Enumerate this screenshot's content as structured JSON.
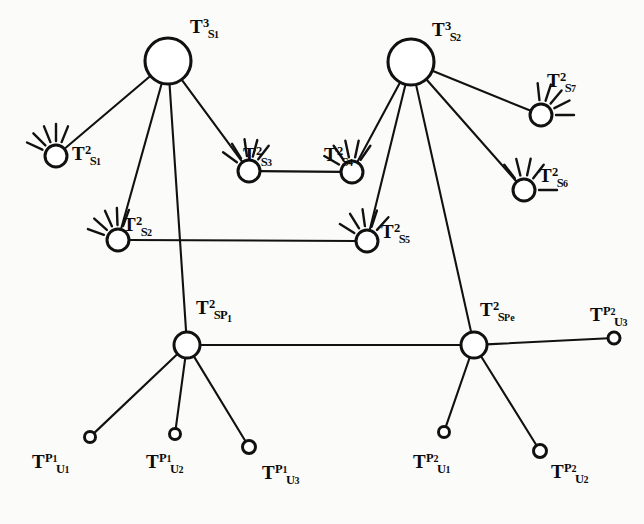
{
  "figure": {
    "type": "node-link-diagram",
    "background_color": "#fbfbf9",
    "ink_color": "#111111",
    "width": 644,
    "height": 524
  },
  "nodes": [
    {
      "id": "TS1_3",
      "kind": "hub",
      "label_base": "T",
      "label_sup": "3",
      "label_sub": "S",
      "label_subsub": "1",
      "x": 168,
      "y": 61,
      "r": 23,
      "label_x": 190,
      "label_y": 17,
      "rays": []
    },
    {
      "id": "TS2_3",
      "kind": "hub",
      "label_base": "T",
      "label_sup": "3",
      "label_sub": "S",
      "label_subsub": "2",
      "x": 411,
      "y": 62,
      "r": 23,
      "label_x": 432,
      "label_y": 20,
      "rays": []
    },
    {
      "id": "TS1_2",
      "kind": "mid",
      "label_base": "T",
      "label_sup": "2",
      "label_sub": "S",
      "label_subsub": "1",
      "x": 56,
      "y": 156,
      "r": 11,
      "label_x": 72,
      "label_y": 144,
      "rays": [
        205,
        225,
        248,
        270,
        292
      ]
    },
    {
      "id": "TS2_2",
      "kind": "mid",
      "label_base": "T",
      "label_sup": "2",
      "label_sub": "S",
      "label_subsub": "2",
      "x": 118,
      "y": 240,
      "r": 11,
      "label_x": 123,
      "label_y": 215,
      "rays": [
        200,
        222,
        246,
        268,
        290
      ]
    },
    {
      "id": "TS3_2",
      "kind": "mid",
      "label_base": "T",
      "label_sup": "2",
      "label_sub": "S",
      "label_subsub": "3",
      "x": 249,
      "y": 171,
      "r": 11,
      "label_x": 243,
      "label_y": 145,
      "rays": [
        216,
        238,
        262,
        285,
        308
      ]
    },
    {
      "id": "TS4_2",
      "kind": "mid",
      "label_base": "T",
      "label_sup": "2",
      "label_sub": "S",
      "label_subsub": "4",
      "x": 352,
      "y": 172,
      "r": 11,
      "label_x": 324,
      "label_y": 145,
      "rays": [
        210,
        235,
        258,
        282,
        305
      ]
    },
    {
      "id": "TS5_2",
      "kind": "mid",
      "label_base": "T",
      "label_sup": "2",
      "label_sub": "S",
      "label_subsub": "5",
      "x": 367,
      "y": 241,
      "r": 11,
      "label_x": 381,
      "label_y": 222,
      "rays": [
        212,
        238,
        262,
        288,
        312
      ]
    },
    {
      "id": "TS6_2",
      "kind": "mid",
      "label_base": "T",
      "label_sup": "2",
      "label_sub": "S",
      "label_subsub": "6",
      "x": 524,
      "y": 190,
      "r": 11,
      "label_x": 539,
      "label_y": 166,
      "rays": [
        0,
        232,
        256,
        282,
        308
      ]
    },
    {
      "id": "TS7_2",
      "kind": "mid",
      "label_base": "T",
      "label_sup": "2",
      "label_sub": "S",
      "label_subsub": "7",
      "x": 541,
      "y": 115,
      "r": 11,
      "label_x": 547,
      "label_y": 71,
      "rays": [
        0,
        333,
        310,
        288,
        264
      ]
    },
    {
      "id": "TSP1_2",
      "kind": "mid",
      "label_base": "T",
      "label_sup": "2",
      "label_sub": "S",
      "label_subsub": "P1",
      "x": 187,
      "y": 345,
      "r": 13,
      "label_x": 196,
      "label_y": 298,
      "rays": []
    },
    {
      "id": "TSPe_2",
      "kind": "mid",
      "label_base": "T",
      "label_sup": "2",
      "label_sub": "S",
      "label_subsub": "Pe",
      "x": 474,
      "y": 345,
      "r": 13,
      "label_x": 480,
      "label_y": 300,
      "rays": []
    },
    {
      "id": "TU1_P1",
      "kind": "leaf",
      "label_base": "T",
      "label_sup": "P1",
      "label_sub": "U",
      "label_subsub": "1",
      "x": 90,
      "y": 437,
      "r": 5.5,
      "label_x": 32,
      "label_y": 452,
      "rays": []
    },
    {
      "id": "TU2_P1",
      "kind": "leaf",
      "label_base": "T",
      "label_sup": "P1",
      "label_sub": "U",
      "label_subsub": "2",
      "x": 175,
      "y": 434,
      "r": 5.5,
      "label_x": 146,
      "label_y": 452,
      "rays": []
    },
    {
      "id": "TU3_P1",
      "kind": "leaf",
      "label_base": "T",
      "label_sup": "P1",
      "label_sub": "U",
      "label_subsub": "3",
      "x": 249,
      "y": 447,
      "r": 6.5,
      "label_x": 262,
      "label_y": 463,
      "rays": []
    },
    {
      "id": "TU1_P2",
      "kind": "leaf",
      "label_base": "T",
      "label_sup": "P2",
      "label_sub": "U",
      "label_subsub": "1",
      "x": 444,
      "y": 432,
      "r": 5.5,
      "label_x": 413,
      "label_y": 452,
      "rays": []
    },
    {
      "id": "TU2_P2",
      "kind": "leaf",
      "label_base": "T",
      "label_sup": "P2",
      "label_sub": "U",
      "label_subsub": "2",
      "x": 540,
      "y": 451,
      "r": 6.5,
      "label_x": 551,
      "label_y": 462,
      "rays": []
    },
    {
      "id": "TU3_P2",
      "kind": "leaf",
      "label_base": "T",
      "label_sup": "P2",
      "label_sub": "U",
      "label_subsub": "3",
      "x": 614,
      "y": 338,
      "r": 6.0,
      "label_x": 590,
      "label_y": 305,
      "rays": []
    }
  ],
  "edges": [
    {
      "from": "TS1_3",
      "to": "TS1_2"
    },
    {
      "from": "TS1_3",
      "to": "TS2_2"
    },
    {
      "from": "TS1_3",
      "to": "TS3_2"
    },
    {
      "from": "TS1_3",
      "to": "TSP1_2"
    },
    {
      "from": "TS2_3",
      "to": "TS4_2"
    },
    {
      "from": "TS2_3",
      "to": "TS5_2"
    },
    {
      "from": "TS2_3",
      "to": "TS6_2"
    },
    {
      "from": "TS2_3",
      "to": "TS7_2"
    },
    {
      "from": "TS2_3",
      "to": "TSPe_2"
    },
    {
      "from": "TS3_2",
      "to": "TS4_2"
    },
    {
      "from": "TS2_2",
      "to": "TS5_2"
    },
    {
      "from": "TSP1_2",
      "to": "TSPe_2"
    },
    {
      "from": "TSP1_2",
      "to": "TU1_P1"
    },
    {
      "from": "TSP1_2",
      "to": "TU2_P1"
    },
    {
      "from": "TSP1_2",
      "to": "TU3_P1"
    },
    {
      "from": "TSPe_2",
      "to": "TU1_P2"
    },
    {
      "from": "TSPe_2",
      "to": "TU2_P2"
    },
    {
      "from": "TSPe_2",
      "to": "TU3_P2"
    }
  ]
}
